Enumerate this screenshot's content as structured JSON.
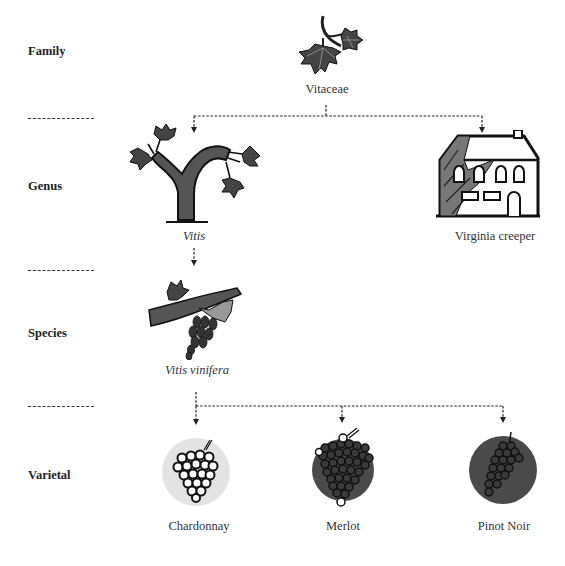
{
  "diagram": {
    "type": "taxonomy-hierarchy",
    "ranks": [
      {
        "label": "Family"
      },
      {
        "label": "Genus"
      },
      {
        "label": "Species"
      },
      {
        "label": "Varietal"
      }
    ],
    "nodes": {
      "vitaceae": {
        "label": "Vitaceae",
        "rank": "Family",
        "icon": "vine-leaf-icon"
      },
      "vitis": {
        "label": "Vitis",
        "rank": "Genus",
        "icon": "grapevine-trunk-icon"
      },
      "virginia_creeper": {
        "label": "Virginia creeper",
        "rank": "Genus",
        "icon": "ivy-covered-house-icon"
      },
      "vitis_vinifera": {
        "label": "Vitis vinifera",
        "rank": "Species",
        "icon": "vine-branch-with-grapes-icon"
      },
      "chardonnay": {
        "label": "Chardonnay",
        "rank": "Varietal",
        "icon": "white-grape-cluster-icon",
        "circle_color": "#e3e3e3"
      },
      "merlot": {
        "label": "Merlot",
        "rank": "Varietal",
        "icon": "merlot-grape-cluster-icon",
        "circle_color": "#4a4a4a"
      },
      "pinot_noir": {
        "label": "Pinot Noir",
        "rank": "Varietal",
        "icon": "pinot-noir-grape-cluster-icon",
        "circle_color": "#4a4a4a"
      }
    },
    "edges": [
      {
        "from": "Vitaceae",
        "to": "Vitis"
      },
      {
        "from": "Vitaceae",
        "to": "Virginia creeper"
      },
      {
        "from": "Vitis",
        "to": "Vitis vinifera"
      },
      {
        "from": "Vitis vinifera",
        "to": "Chardonnay"
      },
      {
        "from": "Vitis vinifera",
        "to": "Merlot"
      },
      {
        "from": "Vitis vinifera",
        "to": "Pinot Noir"
      }
    ],
    "colors": {
      "ink": "#1a1a1a",
      "trunk_fill": "#555555",
      "light_circle": "#e3e3e3",
      "dark_circle": "#4a4a4a"
    }
  }
}
